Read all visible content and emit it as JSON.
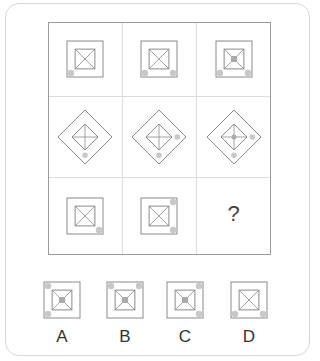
{
  "puzzle": {
    "question_mark": "?",
    "line_color": "#8a8a8a",
    "dot_color": "#c8c8c8",
    "grid": [
      [
        {
          "shape": "square",
          "inner": "x",
          "center_fill": false,
          "dots": [
            "bottom-left"
          ]
        },
        {
          "shape": "square",
          "inner": "x",
          "center_fill": false,
          "dots": [
            "bottom-left",
            "bottom-right"
          ]
        },
        {
          "shape": "square",
          "inner": "x",
          "center_fill": true,
          "dots": [
            "bottom-left",
            "bottom-right"
          ]
        }
      ],
      [
        {
          "shape": "diamond",
          "inner": "cross",
          "center_fill": false,
          "dots": [
            "bottom"
          ]
        },
        {
          "shape": "diamond",
          "inner": "cross",
          "center_fill": false,
          "dots": [
            "bottom",
            "right"
          ]
        },
        {
          "shape": "diamond",
          "inner": "cross",
          "center_fill": true,
          "dots": [
            "bottom",
            "right"
          ]
        }
      ],
      [
        {
          "shape": "square",
          "inner": "x",
          "center_fill": false,
          "dots": [
            "bottom-right"
          ]
        },
        {
          "shape": "square",
          "inner": "x",
          "center_fill": false,
          "dots": [
            "top-right",
            "bottom-right"
          ]
        },
        {
          "shape": "missing"
        }
      ]
    ]
  },
  "options": [
    {
      "label": "A",
      "shape": "square",
      "inner": "x",
      "center_fill": true,
      "dots": [
        "top-left",
        "bottom-left"
      ]
    },
    {
      "label": "B",
      "shape": "square",
      "inner": "x",
      "center_fill": true,
      "dots": [
        "top-left",
        "top-right"
      ]
    },
    {
      "label": "C",
      "shape": "square",
      "inner": "x",
      "center_fill": true,
      "dots": [
        "top-right",
        "bottom-right"
      ]
    },
    {
      "label": "D",
      "shape": "square",
      "inner": "x",
      "center_fill": false,
      "dots": [
        "bottom-left",
        "bottom-right"
      ]
    }
  ]
}
